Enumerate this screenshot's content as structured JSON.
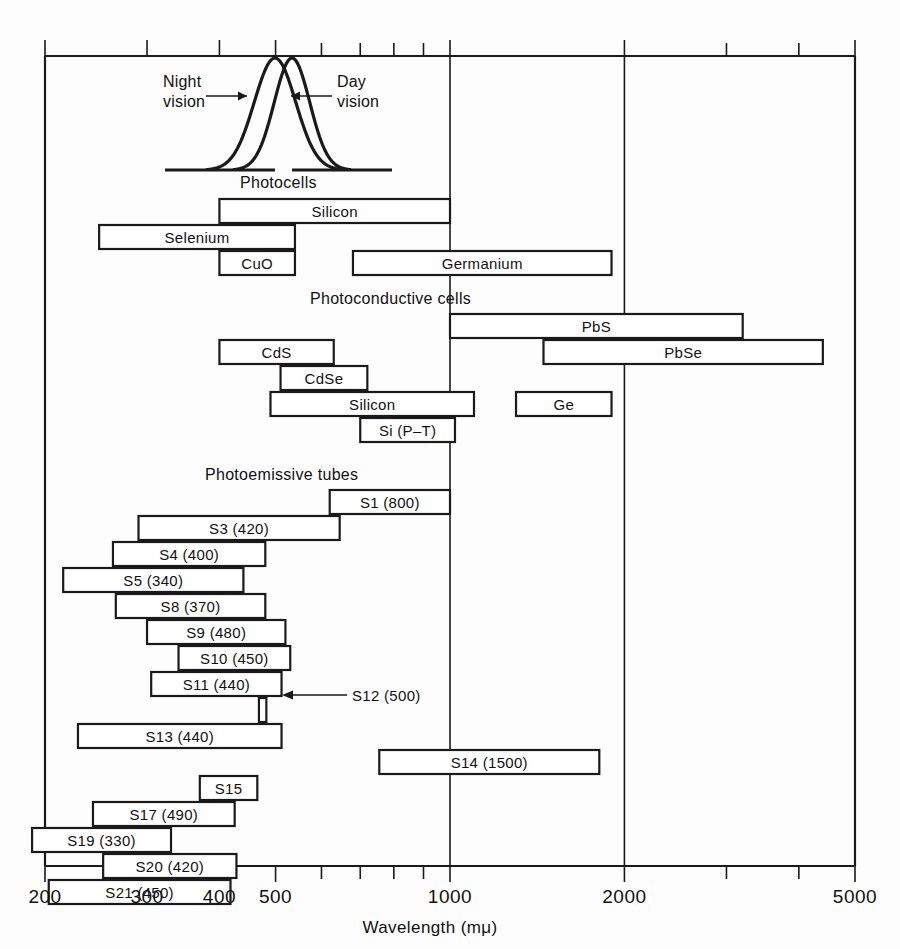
{
  "chart_data": {
    "type": "bar",
    "xlabel": "Wavelength  (mμ)",
    "ylabel": "",
    "xscale": "log",
    "xlim": [
      200,
      5000
    ],
    "grid": true,
    "legend": null,
    "xticks": [
      {
        "value": 200,
        "label": "200",
        "major": true
      },
      {
        "value": 300,
        "label": "300",
        "major": true
      },
      {
        "value": 400,
        "label": "400",
        "major": true
      },
      {
        "value": 500,
        "label": "500",
        "major": true
      },
      {
        "value": 600,
        "label": "",
        "major": false
      },
      {
        "value": 700,
        "label": "",
        "major": false
      },
      {
        "value": 800,
        "label": "",
        "major": false
      },
      {
        "value": 900,
        "label": "",
        "major": false
      },
      {
        "value": 1000,
        "label": "1000",
        "major": true
      },
      {
        "value": 2000,
        "label": "2000",
        "major": true
      },
      {
        "value": 3000,
        "label": "",
        "major": false
      },
      {
        "value": 4000,
        "label": "",
        "major": false
      },
      {
        "value": 5000,
        "label": "5000",
        "major": true
      }
    ],
    "gridlines": [
      1000,
      2000
    ],
    "sections": [
      {
        "id": "photocells",
        "label": "Photocells",
        "label_x": 390,
        "bars": [
          {
            "name": "Silicon",
            "label": "Silicon",
            "start": 400,
            "end": 1000,
            "row": 0
          },
          {
            "name": "Selenium",
            "label": "Selenium",
            "start": 248,
            "end": 540,
            "row": 1
          },
          {
            "name": "CuO",
            "label": "CuO",
            "start": 400,
            "end": 540,
            "row": 2
          },
          {
            "name": "Germanium",
            "label": "Germanium",
            "start": 680,
            "end": 1900,
            "row": 2
          }
        ]
      },
      {
        "id": "photoconductive-cells",
        "label": "Photoconductive  cells",
        "label_x": 600,
        "bars": [
          {
            "name": "PbS",
            "label": "PbS",
            "start": 1000,
            "end": 3200,
            "row": 0
          },
          {
            "name": "PbSe",
            "label": "PbSe",
            "start": 1450,
            "end": 4400,
            "row": 1
          },
          {
            "name": "CdS",
            "label": "CdS",
            "start": 400,
            "end": 630,
            "row": 1
          },
          {
            "name": "CdSe",
            "label": "CdSe",
            "start": 510,
            "end": 720,
            "row": 2
          },
          {
            "name": "Silicon",
            "label": "Silicon",
            "start": 490,
            "end": 1100,
            "row": 3
          },
          {
            "name": "Ge",
            "label": "Ge",
            "start": 1300,
            "end": 1900,
            "row": 3
          },
          {
            "name": "Si (P-T)",
            "label": "Si  (P–T)",
            "start": 700,
            "end": 1020,
            "row": 4
          }
        ]
      },
      {
        "id": "photoemissive-tubes",
        "label": "Photoemissive  tubes",
        "label_x": 470,
        "bars": [
          {
            "name": "S1",
            "label": "S1  (800)",
            "start": 620,
            "end": 1000,
            "row": 0
          },
          {
            "name": "S3",
            "label": "S3  (420)",
            "start": 290,
            "end": 645,
            "row": 1
          },
          {
            "name": "S4",
            "label": "S4  (400)",
            "start": 262,
            "end": 480,
            "row": 2
          },
          {
            "name": "S5",
            "label": "S5  (340)",
            "start": 215,
            "end": 440,
            "row": 3
          },
          {
            "name": "S8",
            "label": "S8  (370)",
            "start": 265,
            "end": 480,
            "row": 4
          },
          {
            "name": "S9",
            "label": "S9  (480)",
            "start": 300,
            "end": 520,
            "row": 5
          },
          {
            "name": "S10",
            "label": "S10  (450)",
            "start": 340,
            "end": 530,
            "row": 6
          },
          {
            "name": "S11",
            "label": "S11  (440)",
            "start": 305,
            "end": 512,
            "row": 7
          },
          {
            "name": "S12",
            "label": "",
            "start": 468,
            "end": 482,
            "row": 8
          },
          {
            "name": "S13",
            "label": "S13  (440)",
            "start": 228,
            "end": 512,
            "row": 9
          },
          {
            "name": "S14",
            "label": "S14  (1500)",
            "start": 755,
            "end": 1810,
            "row": 10
          },
          {
            "name": "S15",
            "label": "S15",
            "start": 370,
            "end": 465,
            "row": 11
          },
          {
            "name": "S17",
            "label": "S17  (490)",
            "start": 242,
            "end": 425,
            "row": 12
          },
          {
            "name": "S19",
            "label": "S19  (330)",
            "start": 190,
            "end": 330,
            "row": 13
          },
          {
            "name": "S20",
            "label": "S20  (420)",
            "start": 252,
            "end": 428,
            "row": 14
          },
          {
            "name": "S21",
            "label": "S21  (450)",
            "start": 203,
            "end": 418,
            "row": 15
          }
        ]
      }
    ],
    "annotations": [
      {
        "name": "s12-callout",
        "text": "S12  (500)",
        "x": 352,
        "y": 687
      },
      {
        "name": "night-vision-label",
        "text": "Night\nvision",
        "x": 163,
        "y": 80
      },
      {
        "name": "day-vision-label",
        "text": "Day\nvision",
        "x": 337,
        "y": 80
      }
    ],
    "curves": [
      {
        "name": "night-vision",
        "peak_nm": 507,
        "label": "Night vision"
      },
      {
        "name": "day-vision",
        "peak_nm": 555,
        "label": "Day vision"
      }
    ]
  },
  "axis": {
    "title": "Wavelength  (mμ)",
    "tick_labels": [
      "200",
      "300",
      "400",
      "500",
      "1000",
      "2000",
      "5000"
    ]
  },
  "labels": {
    "photocells": "Photocells",
    "photoconductive_cells": "Photoconductive  cells",
    "photoemissive_tubes": "Photoemissive  tubes",
    "night_vision_line1": "Night",
    "night_vision_line2": "vision",
    "day_vision_line1": "Day",
    "day_vision_line2": "vision",
    "s12_callout": "S12  (500)"
  },
  "colors": {
    "background": "#fdfdfd",
    "line": "#1a1a1a",
    "text": "#111111"
  }
}
